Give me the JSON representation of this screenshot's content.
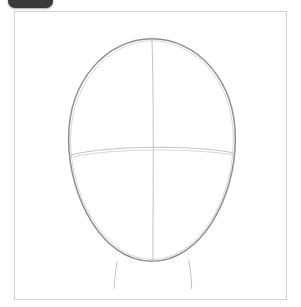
{
  "badge": {
    "label": "",
    "color": "#3a3a3c",
    "shape": "rounded-rectangle",
    "clipped": "top"
  },
  "card": {
    "background_color": "#ffffff",
    "border_color": "#d2d2d2",
    "x": 14,
    "y": 11,
    "width": 273,
    "height": 289
  },
  "drawing": {
    "title": "Head construction guide sketch",
    "medium": "graphite pencil",
    "stroke_colors": {
      "outline": "#8e8e90",
      "centerline": "#c2c2c4",
      "eyeline": "#c2c2c4",
      "neck": "#c2c2c4"
    },
    "elements": [
      {
        "name": "head-oval",
        "type": "ellipse",
        "center_x": 152,
        "center_y": 150,
        "radius_x": 84,
        "radius_y": 113,
        "description": "Egg-shaped head outline, slightly narrower at the chin"
      },
      {
        "name": "vertical-center-line",
        "type": "line",
        "from_x": 152,
        "from_y": 38,
        "to_x": 153,
        "to_y": 263,
        "description": "Vertical symmetry axis running from crown to chin"
      },
      {
        "name": "horizontal-eye-line",
        "type": "arc",
        "from_x": 70,
        "from_y": 154,
        "to_x": 235,
        "to_y": 153,
        "peak_y": 147,
        "description": "Gently arched eye-level guideline across the face"
      },
      {
        "name": "neck-line-left",
        "type": "line",
        "from_x": 117,
        "from_y": 262,
        "to_x": 114,
        "to_y": 289,
        "description": "Left side of the neck"
      },
      {
        "name": "neck-line-right",
        "type": "line",
        "from_x": 189,
        "from_y": 260,
        "to_x": 192,
        "to_y": 289,
        "description": "Right side of the neck"
      }
    ]
  }
}
